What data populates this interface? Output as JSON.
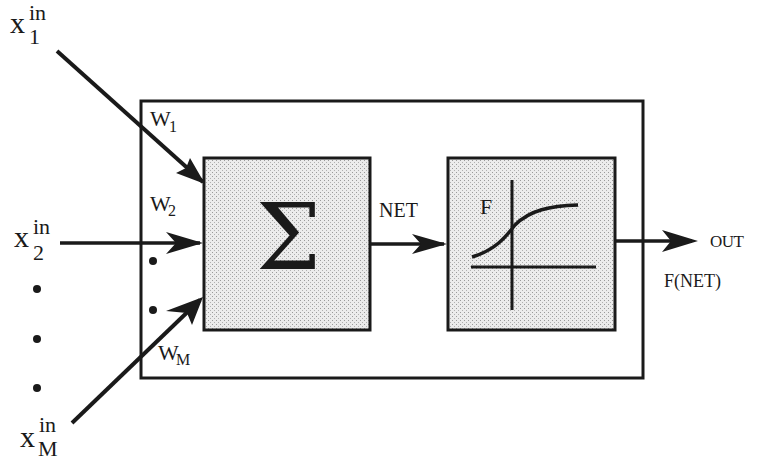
{
  "diagram": {
    "colors": {
      "stroke": "#1a1a1a",
      "block_fill": "#dcdcdc",
      "background": "#ffffff"
    },
    "inputs": [
      {
        "base": "x",
        "sup": "in",
        "sub": "1"
      },
      {
        "base": "x",
        "sup": "in",
        "sub": "2"
      },
      {
        "base": "x",
        "sup": "in",
        "sub": "M"
      }
    ],
    "weights": [
      {
        "base": "W",
        "sub": "1"
      },
      {
        "base": "W",
        "sub": "2"
      },
      {
        "base": "W",
        "sub": "M"
      }
    ],
    "summation_block": {
      "symbol": "Σ"
    },
    "net_label": "NET",
    "activation_block": {
      "label": "F"
    },
    "output": {
      "label": "OUT",
      "formula": "F(NET)"
    }
  }
}
